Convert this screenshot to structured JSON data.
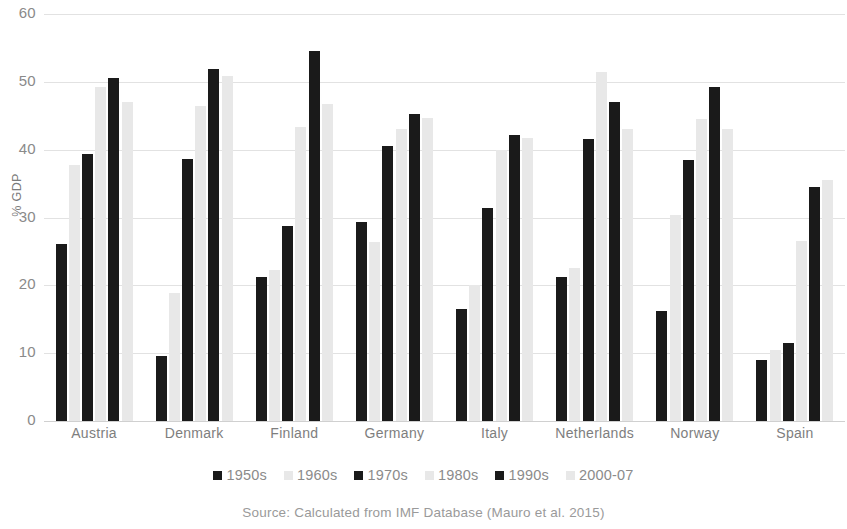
{
  "chart_data": {
    "type": "bar",
    "title": "",
    "subtitle": "",
    "xlabel": "",
    "ylabel": "% GDP",
    "ylim": [
      0,
      60
    ],
    "yticks": [
      0,
      10,
      20,
      30,
      40,
      50,
      60
    ],
    "ytick_labels": [
      "0",
      "10",
      "20",
      "30",
      "40",
      "50",
      "60"
    ],
    "grid": true,
    "legend_position": "bottom",
    "categories": [
      "Austria",
      "Denmark",
      "Finland",
      "Germany",
      "Italy",
      "Netherlands",
      "Norway",
      "Spain"
    ],
    "series": [
      {
        "name": "1950s",
        "color": "#1a1a1a",
        "values": [
          26.1,
          9.6,
          21.2,
          29.4,
          16.5,
          21.2,
          16.2,
          9.0
        ]
      },
      {
        "name": "1960s",
        "color": "#e8e8e8",
        "values": [
          37.7,
          18.8,
          22.3,
          26.4,
          20.0,
          22.5,
          30.4,
          10.5
        ]
      },
      {
        "name": "1970s",
        "color": "#1a1a1a",
        "values": [
          39.4,
          38.6,
          28.7,
          40.5,
          31.4,
          41.6,
          38.5,
          11.5
        ]
      },
      {
        "name": "1980s",
        "color": "#e8e8e8",
        "values": [
          49.3,
          46.4,
          43.3,
          43.0,
          40.0,
          51.5,
          44.5,
          26.5
        ]
      },
      {
        "name": "1990s",
        "color": "#1a1a1a",
        "values": [
          50.5,
          51.9,
          54.6,
          45.2,
          42.2,
          47.0,
          49.2,
          34.5
        ]
      },
      {
        "name": "2000-07",
        "color": "#e8e8e8",
        "values": [
          47.0,
          50.9,
          46.7,
          44.6,
          41.7,
          43.0,
          43.0,
          35.5
        ]
      }
    ],
    "source_note": "Source: Calculated from IMF Database (Mauro et al. 2015)"
  }
}
